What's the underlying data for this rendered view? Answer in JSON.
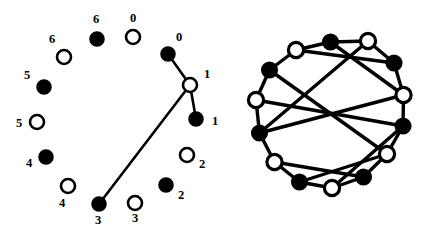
{
  "figure": {
    "title": "",
    "width": 441,
    "height": 234,
    "background": "#ffffff",
    "ink_color": "#000000"
  },
  "chart_data": {
    "type": "diagram",
    "title": "",
    "subtitle": "",
    "xlabel": "",
    "ylabel": "",
    "panels": [
      {
        "name": "left-panel",
        "label": "",
        "node_count": 14,
        "edge_count": 3,
        "colors": {
          "filled": "#000000",
          "hollow_fill": "#ffffff",
          "stroke": "#000000"
        },
        "nodes": [
          {
            "id": "b0",
            "label": "0",
            "fill": "black",
            "cx": 168,
            "cy": 54,
            "r": 7.0,
            "label_x": 179,
            "label_y": 41,
            "label_anchor": "middle"
          },
          {
            "id": "w1",
            "label": "1",
            "fill": "white",
            "cx": 190,
            "cy": 85,
            "r": 7.0,
            "label_x": 207,
            "label_y": 78,
            "label_anchor": "middle"
          },
          {
            "id": "b1",
            "label": "1",
            "fill": "black",
            "cx": 196,
            "cy": 119,
            "r": 7.0,
            "label_x": 215,
            "label_y": 125,
            "label_anchor": "middle"
          },
          {
            "id": "w2",
            "label": "2",
            "fill": "white",
            "cx": 187,
            "cy": 155,
            "r": 7.0,
            "label_x": 202,
            "label_y": 168,
            "label_anchor": "middle"
          },
          {
            "id": "b2",
            "label": "2",
            "fill": "black",
            "cx": 166,
            "cy": 185,
            "r": 7.0,
            "label_x": 181,
            "label_y": 199,
            "label_anchor": "middle"
          },
          {
            "id": "w3",
            "label": "3",
            "fill": "white",
            "cx": 135,
            "cy": 203,
            "r": 7.0,
            "label_x": 135,
            "label_y": 222,
            "label_anchor": "middle"
          },
          {
            "id": "b3",
            "label": "3",
            "fill": "black",
            "cx": 99,
            "cy": 204,
            "r": 7.0,
            "label_x": 98,
            "label_y": 224,
            "label_anchor": "middle"
          },
          {
            "id": "w4",
            "label": "4",
            "fill": "white",
            "cx": 68,
            "cy": 186,
            "r": 7.0,
            "label_x": 62,
            "label_y": 207,
            "label_anchor": "middle"
          },
          {
            "id": "b4",
            "label": "4",
            "fill": "black",
            "cx": 46,
            "cy": 157,
            "r": 7.0,
            "label_x": 29,
            "label_y": 167,
            "label_anchor": "middle"
          },
          {
            "id": "w5",
            "label": "5",
            "fill": "white",
            "cx": 37,
            "cy": 122,
            "r": 7.0,
            "label_x": 19,
            "label_y": 127,
            "label_anchor": "middle"
          },
          {
            "id": "b5",
            "label": "5",
            "fill": "black",
            "cx": 44,
            "cy": 87,
            "r": 7.0,
            "label_x": 27,
            "label_y": 79,
            "label_anchor": "middle"
          },
          {
            "id": "w6",
            "label": "6",
            "fill": "white",
            "cx": 64,
            "cy": 57,
            "r": 7.0,
            "label_x": 52,
            "label_y": 43,
            "label_anchor": "middle"
          },
          {
            "id": "b6",
            "label": "6",
            "fill": "black",
            "cx": 97,
            "cy": 39,
            "r": 7.0,
            "label_x": 96,
            "label_y": 23,
            "label_anchor": "middle"
          },
          {
            "id": "w0",
            "label": "0",
            "fill": "white",
            "cx": 133,
            "cy": 37,
            "r": 7.0,
            "label_x": 133,
            "label_y": 22,
            "label_anchor": "middle"
          }
        ],
        "edges": [
          {
            "from": "b0",
            "to": "w1"
          },
          {
            "from": "w1",
            "to": "b1"
          },
          {
            "from": "w1",
            "to": "b3"
          }
        ]
      },
      {
        "name": "right-panel",
        "label": "",
        "node_count": 14,
        "edge_count": 21,
        "colors": {
          "filled": "#000000",
          "hollow_fill": "#ffffff",
          "stroke": "#000000"
        },
        "nodes": [
          {
            "id": "n0",
            "label": "",
            "fill": "black",
            "cx": 110.5,
            "cy": 42.0
          },
          {
            "id": "n1",
            "label": "",
            "fill": "white",
            "cx": 148.0,
            "cy": 41.0
          },
          {
            "id": "n2",
            "label": "",
            "fill": "black",
            "cx": 174.0,
            "cy": 63.0
          },
          {
            "id": "n3",
            "label": "",
            "fill": "white",
            "cx": 183.5,
            "cy": 95.0
          },
          {
            "id": "n4",
            "label": "",
            "fill": "black",
            "cx": 183.0,
            "cy": 126.0
          },
          {
            "id": "n5",
            "label": "",
            "fill": "white",
            "cx": 167.0,
            "cy": 154.0
          },
          {
            "id": "n6",
            "label": "",
            "fill": "black",
            "cx": 143.5,
            "cy": 177.0
          },
          {
            "id": "n7",
            "label": "",
            "fill": "white",
            "cx": 112.0,
            "cy": 188.0
          },
          {
            "id": "n8",
            "label": "",
            "fill": "black",
            "cx": 79.5,
            "cy": 182.0
          },
          {
            "id": "n9",
            "label": "",
            "fill": "white",
            "cx": 54.5,
            "cy": 162.0
          },
          {
            "id": "n10",
            "label": "",
            "fill": "black",
            "cx": 39.5,
            "cy": 133.0
          },
          {
            "id": "n11",
            "label": "",
            "fill": "white",
            "cx": 36.0,
            "cy": 100.0
          },
          {
            "id": "n12",
            "label": "",
            "fill": "black",
            "cx": 49.5,
            "cy": 70.0
          },
          {
            "id": "n13",
            "label": "",
            "fill": "white",
            "cx": 76.0,
            "cy": 50.0
          }
        ],
        "edges": [
          {
            "from": "n0",
            "to": "n1"
          },
          {
            "from": "n1",
            "to": "n2"
          },
          {
            "from": "n2",
            "to": "n3"
          },
          {
            "from": "n3",
            "to": "n4"
          },
          {
            "from": "n4",
            "to": "n5"
          },
          {
            "from": "n5",
            "to": "n6"
          },
          {
            "from": "n6",
            "to": "n7"
          },
          {
            "from": "n7",
            "to": "n8"
          },
          {
            "from": "n8",
            "to": "n9"
          },
          {
            "from": "n9",
            "to": "n10"
          },
          {
            "from": "n10",
            "to": "n11"
          },
          {
            "from": "n11",
            "to": "n12"
          },
          {
            "from": "n12",
            "to": "n13"
          },
          {
            "from": "n13",
            "to": "n0"
          },
          {
            "from": "n0",
            "to": "n3"
          },
          {
            "from": "n2",
            "to": "n13"
          },
          {
            "from": "n1",
            "to": "n10"
          },
          {
            "from": "n4",
            "to": "n11"
          },
          {
            "from": "n12",
            "to": "n5"
          },
          {
            "from": "n6",
            "to": "n9"
          },
          {
            "from": "n7",
            "to": "n4"
          },
          {
            "from": "n8",
            "to": "n5"
          },
          {
            "from": "n10",
            "to": "n3"
          }
        ]
      }
    ]
  }
}
